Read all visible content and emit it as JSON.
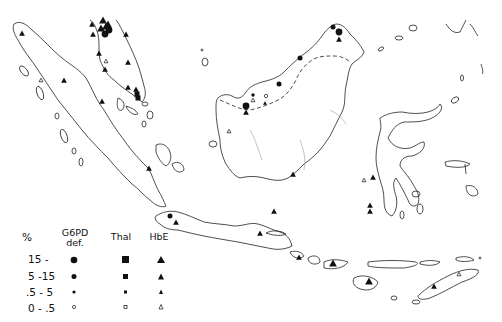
{
  "map": {
    "region": "Indonesia / Malaysia archipelago",
    "legend": {
      "unit_header": "%",
      "columns": [
        {
          "key": "g6pd",
          "label_line1": "G6PD",
          "label_line2": "def.",
          "shape": "circle"
        },
        {
          "key": "thal",
          "label_line1": "Thal",
          "label_line2": "",
          "shape": "square"
        },
        {
          "key": "hbe",
          "label_line1": "HbE",
          "label_line2": "",
          "shape": "triangle"
        }
      ],
      "rows": [
        {
          "label": "15 -",
          "size": "large",
          "filled": true
        },
        {
          "label": "5 -15",
          "size": "medium",
          "filled": true
        },
        {
          "label": ".5 - 5",
          "size": "small",
          "filled": true
        },
        {
          "label": "0 - .5",
          "size": "small",
          "filled": false
        }
      ]
    },
    "markers": [
      {
        "type": "hbe",
        "size": "medium",
        "filled": true,
        "x": 22,
        "y": 33
      },
      {
        "type": "hbe",
        "size": "medium",
        "filled": true,
        "x": 64,
        "y": 80
      },
      {
        "type": "hbe",
        "size": "small",
        "filled": false,
        "x": 41,
        "y": 80
      },
      {
        "type": "hbe",
        "size": "medium",
        "filled": true,
        "x": 92,
        "y": 24
      },
      {
        "type": "hbe",
        "size": "medium",
        "filled": true,
        "x": 93,
        "y": 34
      },
      {
        "type": "hbe",
        "size": "large",
        "filled": true,
        "x": 103,
        "y": 20
      },
      {
        "type": "hbe",
        "size": "large",
        "filled": true,
        "x": 106,
        "y": 26
      },
      {
        "type": "hbe",
        "size": "large",
        "filled": true,
        "x": 101,
        "y": 28
      },
      {
        "type": "g6pd",
        "size": "large",
        "filled": true,
        "x": 105,
        "y": 34
      },
      {
        "type": "g6pd",
        "size": "large",
        "filled": true,
        "x": 109,
        "y": 30
      },
      {
        "type": "hbe",
        "size": "large",
        "filled": true,
        "x": 108,
        "y": 24
      },
      {
        "type": "hbe",
        "size": "medium",
        "filled": true,
        "x": 126,
        "y": 34
      },
      {
        "type": "hbe",
        "size": "medium",
        "filled": true,
        "x": 99,
        "y": 53
      },
      {
        "type": "hbe",
        "size": "small",
        "filled": false,
        "x": 106,
        "y": 61
      },
      {
        "type": "hbe",
        "size": "medium",
        "filled": true,
        "x": 105,
        "y": 69
      },
      {
        "type": "hbe",
        "size": "medium",
        "filled": true,
        "x": 128,
        "y": 62
      },
      {
        "type": "hbe",
        "size": "medium",
        "filled": true,
        "x": 128,
        "y": 87
      },
      {
        "type": "hbe",
        "size": "medium",
        "filled": true,
        "x": 136,
        "y": 89
      },
      {
        "type": "thal",
        "size": "medium",
        "filled": true,
        "x": 137,
        "y": 94
      },
      {
        "type": "thal",
        "size": "medium",
        "filled": true,
        "x": 138,
        "y": 98
      },
      {
        "type": "hbe",
        "size": "medium",
        "filled": true,
        "x": 102,
        "y": 101
      },
      {
        "type": "hbe",
        "size": "medium",
        "filled": true,
        "x": 149,
        "y": 168
      },
      {
        "type": "g6pd",
        "size": "medium",
        "filled": true,
        "x": 170,
        "y": 216
      },
      {
        "type": "hbe",
        "size": "medium",
        "filled": true,
        "x": 176,
        "y": 222
      },
      {
        "type": "hbe",
        "size": "medium",
        "filled": true,
        "x": 260,
        "y": 233
      },
      {
        "type": "hbe",
        "size": "medium",
        "filled": true,
        "x": 274,
        "y": 211
      },
      {
        "type": "hbe",
        "size": "medium",
        "filled": true,
        "x": 299,
        "y": 257
      },
      {
        "type": "g6pd",
        "size": "medium",
        "filled": true,
        "x": 333,
        "y": 27
      },
      {
        "type": "g6pd",
        "size": "large",
        "filled": true,
        "x": 339,
        "y": 32
      },
      {
        "type": "hbe",
        "size": "medium",
        "filled": true,
        "x": 339,
        "y": 39
      },
      {
        "type": "g6pd",
        "size": "medium",
        "filled": true,
        "x": 300,
        "y": 58
      },
      {
        "type": "g6pd",
        "size": "medium",
        "filled": true,
        "x": 279,
        "y": 84
      },
      {
        "type": "g6pd",
        "size": "small",
        "filled": true,
        "x": 253,
        "y": 95
      },
      {
        "type": "hbe",
        "size": "small",
        "filled": false,
        "x": 253,
        "y": 100
      },
      {
        "type": "g6pd",
        "size": "small",
        "filled": false,
        "x": 266,
        "y": 96
      },
      {
        "type": "hbe",
        "size": "small",
        "filled": true,
        "x": 265,
        "y": 103
      },
      {
        "type": "g6pd",
        "size": "large",
        "filled": true,
        "x": 246,
        "y": 106
      },
      {
        "type": "hbe",
        "size": "medium",
        "filled": true,
        "x": 246,
        "y": 112
      },
      {
        "type": "hbe",
        "size": "small",
        "filled": false,
        "x": 229,
        "y": 131
      },
      {
        "type": "hbe",
        "size": "medium",
        "filled": true,
        "x": 293,
        "y": 174
      },
      {
        "type": "hbe",
        "size": "small",
        "filled": false,
        "x": 364,
        "y": 180
      },
      {
        "type": "hbe",
        "size": "medium",
        "filled": true,
        "x": 373,
        "y": 177
      },
      {
        "type": "hbe",
        "size": "medium",
        "filled": true,
        "x": 370,
        "y": 205
      },
      {
        "type": "hbe",
        "size": "medium",
        "filled": true,
        "x": 370,
        "y": 211
      },
      {
        "type": "hbe",
        "size": "large",
        "filled": true,
        "x": 333,
        "y": 263
      },
      {
        "type": "hbe",
        "size": "large",
        "filled": true,
        "x": 369,
        "y": 281
      },
      {
        "type": "hbe",
        "size": "medium",
        "filled": true,
        "x": 434,
        "y": 286
      },
      {
        "type": "hbe",
        "size": "small",
        "filled": false,
        "x": 459,
        "y": 274
      }
    ]
  }
}
